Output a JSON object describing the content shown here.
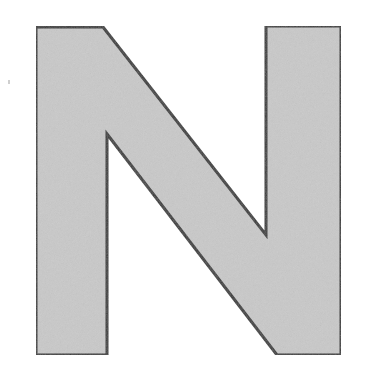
{
  "letter": {
    "character": "N",
    "fill_color": "#c9c9c9",
    "stroke_color": "#3a3a3a",
    "stroke_width": 3,
    "outline_points": "36,27 103,27 266,235 266,26 341,26 341,355 277,355 107,134 107,355 36,355"
  }
}
